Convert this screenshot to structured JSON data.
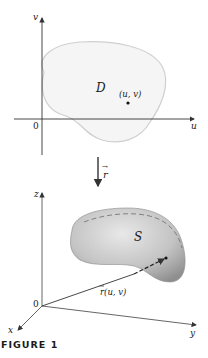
{
  "figure": {
    "caption": "FIGURE 1",
    "colors": {
      "axis": "#333333",
      "region_fill": "#f4f4f4",
      "region_stroke": "#cfcfcf",
      "surface_light": "#e6e6e6",
      "surface_dark": "#9c9c9c",
      "dash": "#7a7a7a"
    }
  },
  "top_plane": {
    "vertical_axis_label": "v",
    "horizontal_axis_label": "u",
    "origin_label": "0",
    "region_label": "D",
    "point_label": "(u, v)"
  },
  "mapping": {
    "arrow_label": "r",
    "arrow_vector_mark": "→"
  },
  "space": {
    "z_axis_label": "z",
    "y_axis_label": "y",
    "x_axis_label": "x",
    "origin_label": "0",
    "surface_label": "S",
    "position_vector_label": "r(u, v)",
    "position_vector_mark": "→"
  }
}
